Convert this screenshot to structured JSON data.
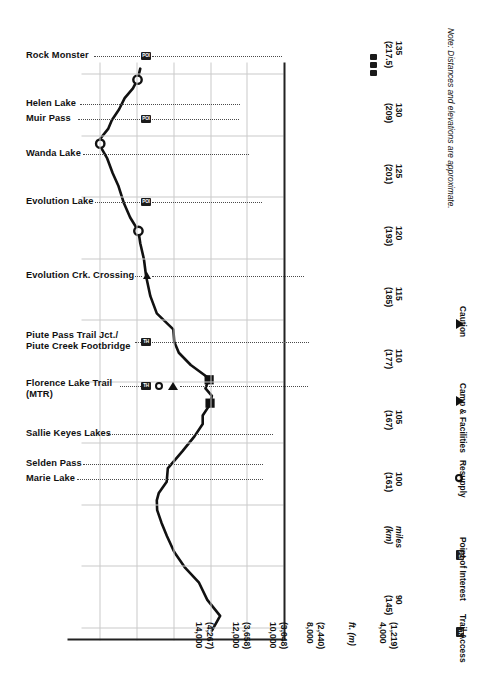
{
  "chart_data": {
    "type": "line",
    "xlabel_primary": "miles",
    "xlabel_secondary": "(km)",
    "ylabel_primary": "ft.",
    "ylabel_secondary": "(m)",
    "xlim": [
      89.0,
      136.0
    ],
    "ylim": [
      4000,
      15000
    ],
    "grid": true,
    "orientation": "rotated-90",
    "x_ticks": [
      {
        "miles": "90",
        "km": "(145)"
      },
      {
        "miles": "100",
        "km": "(161)"
      },
      {
        "miles": "105",
        "km": "(167)"
      },
      {
        "miles": "110",
        "km": "(177)"
      },
      {
        "miles": "115",
        "km": "(185)"
      },
      {
        "miles": "120",
        "km": "(193)"
      },
      {
        "miles": "125",
        "km": "(201)"
      },
      {
        "miles": "130",
        "km": "(209)"
      },
      {
        "miles": "135",
        "km": "(217.5)"
      }
    ],
    "x_axis_unit_label": {
      "primary": "miles",
      "secondary": "(km)"
    },
    "y_ticks": [
      {
        "ft": "14,000",
        "m": "(4,267)"
      },
      {
        "ft": "12,000",
        "m": "(3,658)"
      },
      {
        "ft": "10,000",
        "m": "(3,048)"
      },
      {
        "ft": "8,000",
        "m": "(2,440)"
      },
      {
        "ft": "4,000",
        "m": "(1,219)"
      }
    ],
    "y_axis_unit_label": {
      "primary": "ft.",
      "secondary": "(m)"
    },
    "series": [
      {
        "name": "Elevation",
        "points": [
          [
            89.8,
            7900
          ],
          [
            91.0,
            7450
          ],
          [
            92.3,
            8150
          ],
          [
            93.7,
            8600
          ],
          [
            94.9,
            9350
          ],
          [
            96.2,
            9950
          ],
          [
            97.5,
            10350
          ],
          [
            98.6,
            10650
          ],
          [
            99.6,
            10880
          ],
          [
            100.4,
            10900
          ],
          [
            101.0,
            10790
          ],
          [
            101.9,
            10360
          ],
          [
            103.0,
            10300
          ],
          [
            104.4,
            9500
          ],
          [
            105.6,
            8850
          ],
          [
            106.6,
            8400
          ],
          [
            107.3,
            8400
          ],
          [
            108.2,
            8000
          ],
          [
            108.9,
            7900
          ],
          [
            109.5,
            8250
          ],
          [
            110.3,
            8050
          ],
          [
            111.4,
            9050
          ],
          [
            112.4,
            9700
          ],
          [
            113.3,
            9950
          ],
          [
            114.3,
            10000
          ],
          [
            115.6,
            10900
          ],
          [
            117.0,
            11250
          ],
          [
            118.6,
            11480
          ],
          [
            120.0,
            11600
          ],
          [
            121.3,
            11800
          ],
          [
            122.3,
            11900
          ],
          [
            123.4,
            12350
          ],
          [
            124.6,
            12700
          ],
          [
            126.0,
            13000
          ],
          [
            127.0,
            13300
          ],
          [
            128.2,
            13600
          ],
          [
            129.2,
            13980
          ],
          [
            129.8,
            13980
          ],
          [
            130.6,
            13550
          ],
          [
            131.3,
            13350
          ],
          [
            132.2,
            12950
          ],
          [
            133.1,
            12650
          ],
          [
            133.9,
            12200
          ],
          [
            134.6,
            11950
          ],
          [
            135.5,
            11800
          ]
        ]
      }
    ],
    "markers": [
      {
        "label": "Rock Monster",
        "type": "circle",
        "miles": 134.6,
        "elevation_ft": 11950
      },
      {
        "label": "Muir Pass",
        "type": "circle",
        "miles": 129.4,
        "elevation_ft": 13980
      },
      {
        "label": "Evolution Lake",
        "type": "circle",
        "miles": 122.3,
        "elevation_ft": 11900
      },
      {
        "label": "Piute Pass Trail Jct./Piute Creek Footbridge",
        "type": "square",
        "miles": 110.2,
        "elevation_ft": 8050
      },
      {
        "label": "Florence Lake Trail (MTR)",
        "type": "square",
        "miles": 108.3,
        "elevation_ft": 8000
      }
    ],
    "annotations": [
      {
        "label": "Rock Monster",
        "miles": 134.6,
        "icons": [
          "POI"
        ]
      },
      {
        "label": "Helen Lake",
        "miles": 130.5,
        "icons": []
      },
      {
        "label": "Muir Pass",
        "miles": 129.4,
        "icons": [
          "POI"
        ]
      },
      {
        "label": "Wanda Lake",
        "miles": 126.5,
        "icons": []
      },
      {
        "label": "Evolution Lake",
        "miles": 122.3,
        "icons": [
          "POI"
        ]
      },
      {
        "label": "Evolution Crk. Crossing",
        "miles": 115.5,
        "icons": [
          "caution"
        ]
      },
      {
        "label": "Piute Pass Trail Jct./",
        "label2": "Piute Creek Footbridge",
        "miles": 110.2,
        "icons": [
          "TH"
        ]
      },
      {
        "label": "Florence Lake Trail",
        "label2": "(MTR)",
        "miles": 108.3,
        "icons": [
          "TH",
          "resupply",
          "camp"
        ]
      },
      {
        "label": "Sallie Keyes Lakes",
        "miles": 104.3,
        "icons": []
      },
      {
        "label": "Selden Pass",
        "miles": 101.8,
        "icons": []
      },
      {
        "label": "Marie Lake",
        "miles": 101.0,
        "icons": []
      }
    ],
    "note": "Note: Distances and elevations are approximate."
  },
  "labels": {
    "rock_monster": "Rock Monster",
    "helen_lake": "Helen Lake",
    "muir_pass": "Muir Pass",
    "wanda_lake": "Wanda Lake",
    "evolution_lake": "Evolution Lake",
    "evolution_crk": "Evolution Crk. Crossing",
    "piute_1": "Piute Pass Trail Jct./",
    "piute_2": "Piute Creek Footbridge",
    "florence_1": "Florence Lake Trail",
    "florence_2": "(MTR)",
    "sallie_keyes": "Sallie Keyes Lakes",
    "selden_pass": "Selden Pass",
    "marie_lake": "Marie Lake"
  },
  "badges": {
    "poi": "POI",
    "th": "TH"
  },
  "legend": {
    "items": [
      {
        "icon": "TH",
        "label": "Trail Access"
      },
      {
        "icon": "POI",
        "label": "Point of Interest"
      },
      {
        "icon": "resupply",
        "label": "Resupply"
      },
      {
        "icon": "camp",
        "label": "Camp & Facilities"
      },
      {
        "icon": "caution",
        "label": "Caution"
      }
    ]
  },
  "axis": {
    "x": {
      "t90": {
        "miles": "90",
        "km": "(145)"
      },
      "unit": {
        "miles": "miles",
        "km": "(km)"
      },
      "t100": {
        "miles": "100",
        "km": "(161)"
      },
      "t105": {
        "miles": "105",
        "km": "(167)"
      },
      "t110": {
        "miles": "110",
        "km": "(177)"
      },
      "t115": {
        "miles": "115",
        "km": "(185)"
      },
      "t120": {
        "miles": "120",
        "km": "(193)"
      },
      "t125": {
        "miles": "125",
        "km": "(201)"
      },
      "t130": {
        "miles": "130",
        "km": "(209)"
      },
      "t135": {
        "miles": "135",
        "km": "(217.5)"
      }
    },
    "y": {
      "e14000": "14,000",
      "e14000m": "(4,267)",
      "e12000": "12,000",
      "e12000m": "(3,658)",
      "e10000": "10,000",
      "e10000m": "(3,048)",
      "e8000": "8,000",
      "e8000m": "(2,440)",
      "unit": "ft. (m)",
      "e4000": "4,000",
      "e4000m": "(1,219)"
    }
  },
  "note": "Note: Distances and elevations are approximate."
}
